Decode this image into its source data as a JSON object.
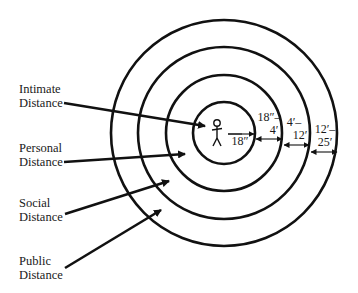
{
  "diagram": {
    "center": {
      "x": 224,
      "y": 133
    },
    "rings": [
      {
        "name": "intimate",
        "radius": 31
      },
      {
        "name": "personal",
        "radius": 58
      },
      {
        "name": "social",
        "radius": 86
      },
      {
        "name": "public",
        "radius": 113
      }
    ],
    "labels": [
      {
        "line1": "Intimate",
        "line2": "Distance"
      },
      {
        "line1": "Personal",
        "line2": "Distance"
      },
      {
        "line1": "Social",
        "line2": "Distance"
      },
      {
        "line1": "Public",
        "line2": "Distance"
      }
    ],
    "dimensions": [
      {
        "line1": "18″",
        "line2": ""
      },
      {
        "line1": "18″–",
        "line2": "4′"
      },
      {
        "line1": "4′–",
        "line2": "12′"
      },
      {
        "line1": "12′–",
        "line2": "25′"
      }
    ],
    "figure": "stick-person-icon",
    "stroke_color": "#111111"
  }
}
